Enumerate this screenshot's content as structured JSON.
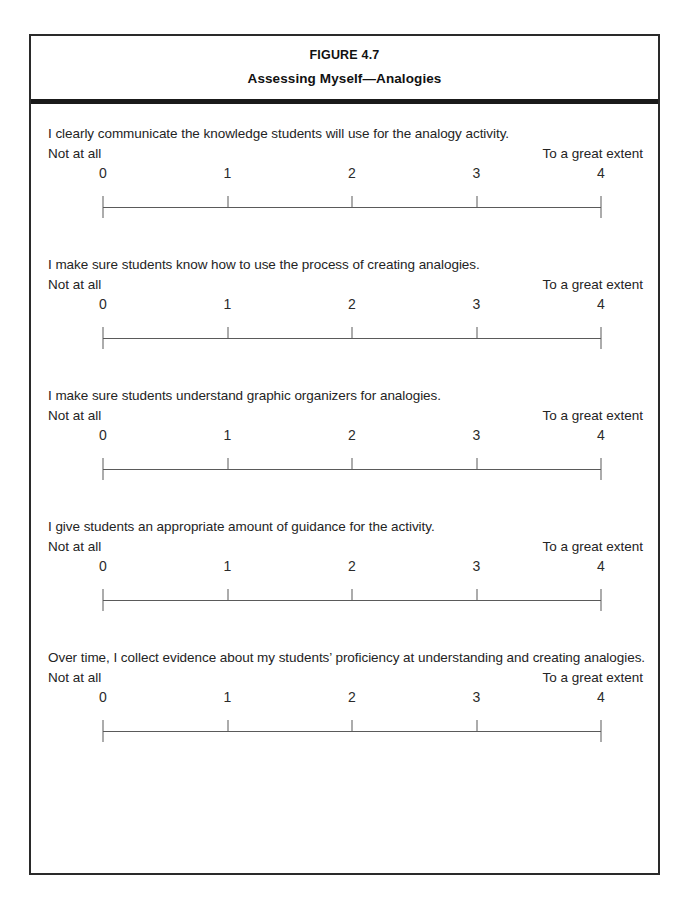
{
  "figure": {
    "number": "FIGURE 4.7",
    "title": "Assessing Myself—Analogies"
  },
  "scale": {
    "anchor_low": "Not at all",
    "anchor_high": "To a great extent",
    "labels": [
      "0",
      "1",
      "2",
      "3",
      "4"
    ],
    "min": 0,
    "max": 4
  },
  "items": [
    {
      "question": "I clearly communicate the knowledge students will use for the analogy activity.",
      "anchor_low": "Not at all",
      "anchor_high": "To a great extent",
      "labels": [
        "0",
        "1",
        "2",
        "3",
        "4"
      ]
    },
    {
      "question": "I make sure students know how to use the process of creating analogies.",
      "anchor_low": "Not at all",
      "anchor_high": "To a great extent",
      "labels": [
        "0",
        "1",
        "2",
        "3",
        "4"
      ]
    },
    {
      "question": "I make sure students understand graphic organizers for analogies.",
      "anchor_low": "Not at all",
      "anchor_high": "To a great extent",
      "labels": [
        "0",
        "1",
        "2",
        "3",
        "4"
      ]
    },
    {
      "question": "I give students an appropriate amount of guidance for the activity.",
      "anchor_low": "Not at all",
      "anchor_high": "To a great extent",
      "labels": [
        "0",
        "1",
        "2",
        "3",
        "4"
      ]
    },
    {
      "question": "Over time, I collect evidence about my students’ proficiency at understanding and creating analogies.",
      "anchor_low": "Not at all",
      "anchor_high": "To a great extent",
      "labels": [
        "0",
        "1",
        "2",
        "3",
        "4"
      ]
    }
  ],
  "colors": {
    "border": "#2a2a2a",
    "rule": "#1a1a1a",
    "text": "#242424",
    "scale_line": "#5a5a5a"
  }
}
